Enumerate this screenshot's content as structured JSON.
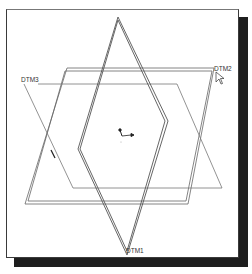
{
  "viewport": {
    "background": "#ffffff",
    "border_color": "#3a3a3a",
    "shadow_color": "#1e1e1e"
  },
  "datums": {
    "dtm1": {
      "label": "DTM1"
    },
    "dtm2": {
      "label": "DTM2"
    },
    "dtm3": {
      "label": "DTM3"
    }
  },
  "line_color": "#555555"
}
